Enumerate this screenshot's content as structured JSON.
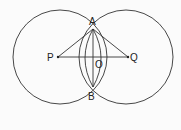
{
  "diagram": {
    "labels": {
      "A": "A",
      "B": "B",
      "P": "P",
      "Q": "Q",
      "O": "O"
    },
    "stroke_color": "#333333",
    "background": "#fbfbfb"
  }
}
